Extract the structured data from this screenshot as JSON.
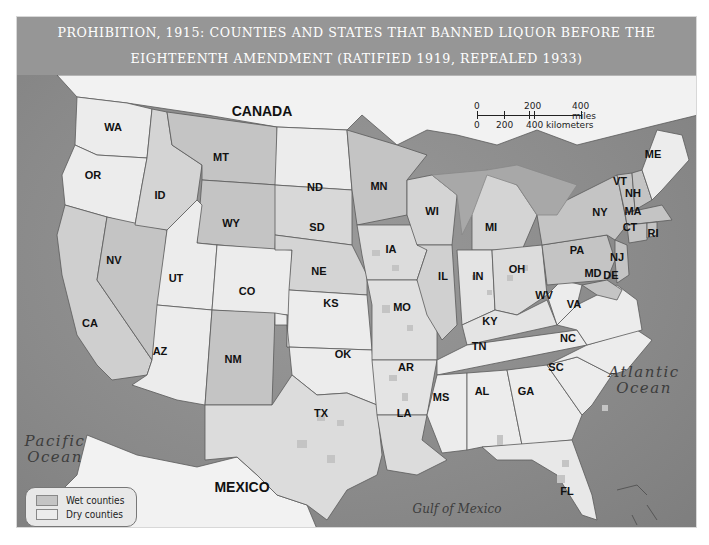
{
  "title": {
    "line1": "PROHIBITION, 1915: COUNTIES AND STATES THAT BANNED LIQUOR BEFORE THE",
    "line2": "EIGHTEENTH AMENDMENT (RATIFIED 1919, REPEALED 1933)"
  },
  "colors": {
    "title_bar": "#969696",
    "ocean": "#8e8e8e",
    "dry": "#ececec",
    "wet": "#c4c4c4",
    "foreign_land": "#f2f2f2",
    "border": "#555555"
  },
  "countries": {
    "canada": "CANADA",
    "mexico": "MEXICO"
  },
  "water": {
    "pacific": [
      "Pacific",
      "Ocean"
    ],
    "atlantic": [
      "Atlantic",
      "Ocean"
    ],
    "gulf": "Gulf of Mexico"
  },
  "scale": {
    "miles": [
      "0",
      "200",
      "400 miles"
    ],
    "km": [
      "0",
      "200",
      "400 kilometers"
    ]
  },
  "legend": {
    "items": [
      {
        "label": "Wet counties",
        "color": "#c4c4c4"
      },
      {
        "label": "Dry counties",
        "color": "#ececec"
      }
    ]
  },
  "states": [
    {
      "abbr": "WA",
      "status": "dry"
    },
    {
      "abbr": "OR",
      "status": "dry"
    },
    {
      "abbr": "CA",
      "status": "mostly wet"
    },
    {
      "abbr": "ID",
      "status": "mixed"
    },
    {
      "abbr": "NV",
      "status": "wet"
    },
    {
      "abbr": "MT",
      "status": "wet"
    },
    {
      "abbr": "WY",
      "status": "wet"
    },
    {
      "abbr": "UT",
      "status": "mixed"
    },
    {
      "abbr": "CO",
      "status": "dry"
    },
    {
      "abbr": "AZ",
      "status": "dry"
    },
    {
      "abbr": "NM",
      "status": "wet"
    },
    {
      "abbr": "ND",
      "status": "dry"
    },
    {
      "abbr": "SD",
      "status": "mixed"
    },
    {
      "abbr": "NE",
      "status": "mixed"
    },
    {
      "abbr": "KS",
      "status": "dry"
    },
    {
      "abbr": "OK",
      "status": "dry"
    },
    {
      "abbr": "TX",
      "status": "mixed"
    },
    {
      "abbr": "MN",
      "status": "wet"
    },
    {
      "abbr": "IA",
      "status": "mixed"
    },
    {
      "abbr": "MO",
      "status": "mixed"
    },
    {
      "abbr": "AR",
      "status": "mostly dry"
    },
    {
      "abbr": "LA",
      "status": "mixed"
    },
    {
      "abbr": "WI",
      "status": "mixed"
    },
    {
      "abbr": "IL",
      "status": "mixed"
    },
    {
      "abbr": "MI",
      "status": "mixed"
    },
    {
      "abbr": "IN",
      "status": "mostly dry"
    },
    {
      "abbr": "OH",
      "status": "mixed"
    },
    {
      "abbr": "KY",
      "status": "mostly dry"
    },
    {
      "abbr": "TN",
      "status": "dry"
    },
    {
      "abbr": "MS",
      "status": "dry"
    },
    {
      "abbr": "AL",
      "status": "dry"
    },
    {
      "abbr": "GA",
      "status": "dry"
    },
    {
      "abbr": "FL",
      "status": "mostly dry"
    },
    {
      "abbr": "SC",
      "status": "dry"
    },
    {
      "abbr": "NC",
      "status": "dry"
    },
    {
      "abbr": "VA",
      "status": "dry"
    },
    {
      "abbr": "WV",
      "status": "dry"
    },
    {
      "abbr": "PA",
      "status": "wet"
    },
    {
      "abbr": "NY",
      "status": "wet"
    },
    {
      "abbr": "VT",
      "status": "wet"
    },
    {
      "abbr": "NH",
      "status": "wet"
    },
    {
      "abbr": "ME",
      "status": "dry"
    },
    {
      "abbr": "MA",
      "status": "wet"
    },
    {
      "abbr": "CT",
      "status": "wet"
    },
    {
      "abbr": "RI",
      "status": "wet"
    },
    {
      "abbr": "NJ",
      "status": "wet"
    },
    {
      "abbr": "MD",
      "status": "wet"
    },
    {
      "abbr": "DE",
      "status": "wet"
    }
  ]
}
